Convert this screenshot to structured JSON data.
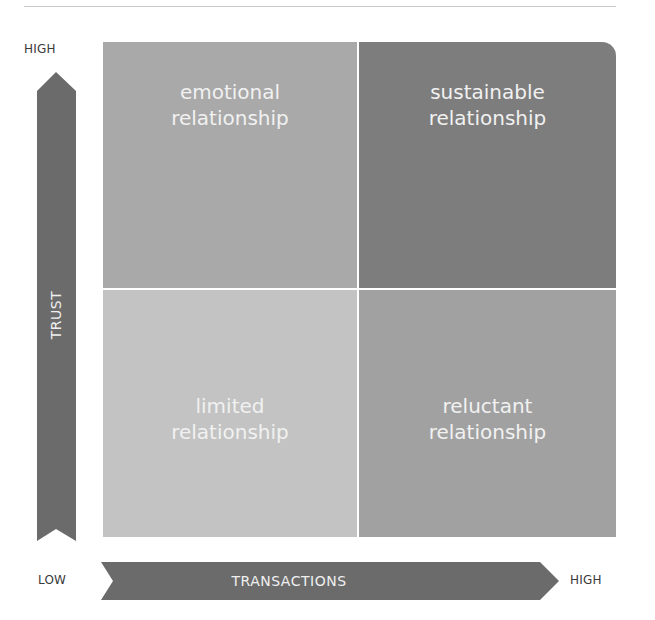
{
  "diagram": {
    "y_axis": {
      "label": "TRUST",
      "high": "HIGH",
      "direction": "up"
    },
    "x_axis": {
      "label": "TRANSACTIONS",
      "low": "LOW",
      "high": "HIGH",
      "direction": "right"
    },
    "quadrants": {
      "top_left": {
        "line1": "emotional",
        "line2": "relationship",
        "color": "#a9a9a9"
      },
      "top_right": {
        "line1": "sustainable",
        "line2": "relationship",
        "color": "#7d7d7d"
      },
      "bottom_left": {
        "line1": "limited",
        "line2": "relationship",
        "color": "#c3c3c3"
      },
      "bottom_right": {
        "line1": "reluctant",
        "line2": "relationship",
        "color": "#a1a1a1"
      }
    },
    "arrow_color": "#6b6b6b",
    "divider_color": "#ffffff"
  }
}
